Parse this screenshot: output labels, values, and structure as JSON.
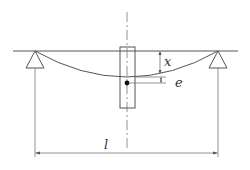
{
  "diagram": {
    "type": "simply-supported beam with eccentric mass",
    "labels": {
      "deflection": "x",
      "eccentricity": "e",
      "span": "l"
    },
    "components": [
      "reference-line",
      "left-pin-support",
      "right-pin-support",
      "deflected-beam",
      "mass-block",
      "centerline",
      "center-of-mass-dot",
      "deflection-dimension",
      "eccentricity-dimension",
      "span-dimension"
    ],
    "colors": {
      "stroke": "#555555",
      "text": "#333333",
      "background": "#ffffff"
    }
  }
}
